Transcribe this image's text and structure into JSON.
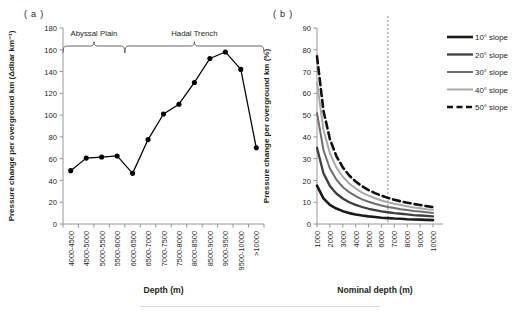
{
  "figure": {
    "panel_a_label": "( a )",
    "panel_b_label": "( b )"
  },
  "chart_data": [
    {
      "type": "line",
      "panel": "a",
      "title": "",
      "xlabel": "Depth (m)",
      "ylabel": "Pressure change per overground km (Δdbar km⁻¹)",
      "ylim": [
        0,
        180
      ],
      "yticks": [
        0,
        20,
        40,
        60,
        80,
        100,
        120,
        140,
        160,
        180
      ],
      "grid": false,
      "legend": "none",
      "marker": "filled-circle",
      "line_color": "#000000",
      "categories": [
        "4000-4500",
        "4500-5000",
        "5000-5500",
        "5500-6000",
        "6000-6500",
        "6500-7000",
        "7000-7500",
        "7500-8000",
        "8000-8500",
        "8500-9000",
        "9000-9500",
        "9500-10000",
        ">10000"
      ],
      "values": [
        49,
        60.5,
        61.5,
        62.5,
        46.5,
        77.5,
        101,
        110,
        130,
        152,
        158,
        142,
        70
      ],
      "annotations": [
        {
          "text": "Abyssal Plain",
          "span_start": "4000-4500",
          "span_end": "6000-6500",
          "style": "curly-brace"
        },
        {
          "text": "Hadal Trench",
          "span_start": "6000-6500",
          "span_end": ">10000",
          "style": "curly-brace"
        }
      ]
    },
    {
      "type": "line",
      "panel": "b",
      "title": "",
      "xlabel": "Nominal depth (m)",
      "ylabel": "Pressure change per overground km (%)",
      "xlim": [
        1000,
        10000
      ],
      "ylim": [
        0,
        90
      ],
      "yticks": [
        0,
        10,
        20,
        30,
        40,
        50,
        60,
        70,
        80,
        90
      ],
      "xticks": [
        1000,
        2000,
        3000,
        4000,
        5000,
        6000,
        7000,
        8000,
        9000,
        10000
      ],
      "grid": false,
      "legend": "right",
      "reference_line": {
        "x": 6500,
        "style": "dashed",
        "color": "#808080"
      },
      "x": [
        1000,
        1500,
        2000,
        2500,
        3000,
        3500,
        4000,
        4500,
        5000,
        5500,
        6000,
        6500,
        7000,
        7500,
        8000,
        8500,
        9000,
        9500,
        10000
      ],
      "series": [
        {
          "name": "10° slope",
          "color": "#1a1a1a",
          "width": 2.6,
          "dash": "none",
          "values": [
            17.6,
            11.8,
            8.8,
            7.1,
            5.9,
            5.0,
            4.4,
            3.9,
            3.5,
            3.2,
            2.9,
            2.7,
            2.5,
            2.4,
            2.2,
            2.1,
            2.0,
            1.9,
            1.8
          ]
        },
        {
          "name": "20° slope",
          "color": "#3f3f3f",
          "width": 2.3,
          "dash": "none",
          "values": [
            35.0,
            23.3,
            17.5,
            14.0,
            11.7,
            10.0,
            8.8,
            7.8,
            7.0,
            6.4,
            5.8,
            5.4,
            5.0,
            4.7,
            4.4,
            4.1,
            3.9,
            3.7,
            3.5
          ]
        },
        {
          "name": "30° slope",
          "color": "#6e6e6e",
          "width": 2.0,
          "dash": "none",
          "values": [
            51.0,
            34.0,
            25.5,
            20.4,
            17.0,
            14.6,
            12.8,
            11.3,
            10.2,
            9.3,
            8.5,
            7.8,
            7.3,
            6.8,
            6.4,
            6.0,
            5.7,
            5.4,
            5.1
          ]
        },
        {
          "name": "40° slope",
          "color": "#a9a9a9",
          "width": 2.0,
          "dash": "none",
          "values": [
            65.0,
            43.3,
            32.5,
            26.0,
            21.7,
            18.6,
            16.3,
            14.4,
            13.0,
            11.8,
            10.8,
            10.0,
            9.3,
            8.7,
            8.1,
            7.6,
            7.2,
            6.8,
            6.5
          ]
        },
        {
          "name": "50° slope",
          "color": "#111111",
          "width": 2.6,
          "dash": "7,4",
          "values": [
            77.0,
            52.0,
            39.0,
            31.2,
            26.0,
            22.3,
            19.5,
            17.3,
            15.6,
            14.2,
            13.0,
            12.0,
            11.1,
            10.4,
            9.8,
            9.2,
            8.7,
            8.2,
            7.8
          ]
        }
      ]
    }
  ]
}
